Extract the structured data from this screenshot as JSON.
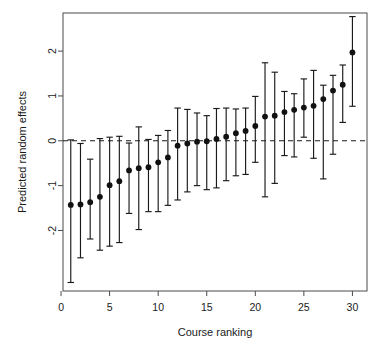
{
  "chart_data": {
    "type": "scatter",
    "title": "",
    "subtitle": "",
    "xlabel": "Course ranking",
    "ylabel": "Predicted random effects",
    "xlim": [
      0.2,
      31.5
    ],
    "ylim": [
      -3.35,
      2.85
    ],
    "xticks": [
      0,
      5,
      10,
      15,
      20,
      25,
      30
    ],
    "xticklabels": [
      "0",
      "5",
      "10",
      "15",
      "20",
      "25",
      "30"
    ],
    "yticks": [
      -2,
      -1,
      0,
      1,
      2
    ],
    "yticklabels": [
      "-2",
      "-1",
      "0",
      "1",
      "2"
    ],
    "grid": false,
    "legend": null,
    "reference_line": {
      "y": 0,
      "style": "dashed",
      "color": "#1a1a1a"
    },
    "error_bar_style": "caps",
    "point_style": "filled-circle",
    "point_color": "#111111",
    "categories": [
      1,
      2,
      3,
      4,
      5,
      6,
      7,
      8,
      9,
      10,
      11,
      12,
      13,
      14,
      15,
      16,
      17,
      18,
      19,
      20,
      21,
      22,
      23,
      24,
      25,
      26,
      27,
      28,
      29,
      30
    ],
    "x": [
      1,
      2,
      3,
      4,
      5,
      6,
      7,
      8,
      9,
      10,
      11,
      12,
      13,
      14,
      15,
      16,
      17,
      18,
      19,
      20,
      21,
      22,
      23,
      24,
      25,
      26,
      27,
      28,
      29,
      30
    ],
    "values": [
      -1.43,
      -1.42,
      -1.37,
      -1.25,
      -0.99,
      -0.9,
      -0.66,
      -0.61,
      -0.59,
      -0.48,
      -0.37,
      -0.11,
      -0.06,
      -0.02,
      -0.01,
      0.04,
      0.09,
      0.17,
      0.22,
      0.33,
      0.54,
      0.56,
      0.64,
      0.69,
      0.74,
      0.78,
      0.93,
      1.12,
      1.25,
      1.97
    ],
    "lower": [
      -3.16,
      -2.61,
      -2.19,
      -2.44,
      -2.35,
      -2.27,
      -1.62,
      -1.98,
      -1.58,
      -1.58,
      -1.44,
      -1.32,
      -1.14,
      -1.0,
      -1.09,
      -1.05,
      -0.89,
      -0.78,
      -0.75,
      -0.48,
      -1.25,
      -0.95,
      -0.33,
      -0.36,
      0.08,
      -0.39,
      -0.85,
      -0.3,
      0.41,
      0.77
    ],
    "upper": [
      0.02,
      -0.06,
      -0.41,
      0.05,
      0.08,
      0.1,
      -0.05,
      0.31,
      0.03,
      0.12,
      0.23,
      0.73,
      0.7,
      0.62,
      0.56,
      0.72,
      0.73,
      0.71,
      0.73,
      0.99,
      1.74,
      1.53,
      1.1,
      1.05,
      1.38,
      1.57,
      1.24,
      1.46,
      1.69,
      2.77
    ],
    "series": [
      {
        "name": "Predicted random effects",
        "values": [
          -1.43,
          -1.42,
          -1.37,
          -1.25,
          -0.99,
          -0.9,
          -0.66,
          -0.61,
          -0.59,
          -0.48,
          -0.37,
          -0.11,
          -0.06,
          -0.02,
          -0.01,
          0.04,
          0.09,
          0.17,
          0.22,
          0.33,
          0.54,
          0.56,
          0.64,
          0.69,
          0.74,
          0.78,
          0.93,
          1.12,
          1.25,
          1.97
        ]
      }
    ]
  }
}
